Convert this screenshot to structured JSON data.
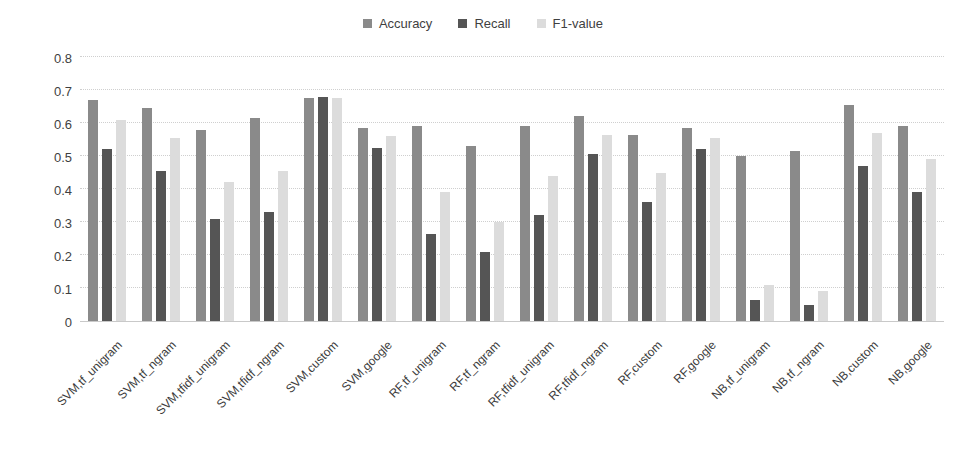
{
  "page": {
    "background": "#ffffff",
    "text_color": "#3f3f3f"
  },
  "legend": {
    "items": [
      {
        "label": "Accuracy",
        "color": "#8a8a8a"
      },
      {
        "label": "Recall",
        "color": "#555555"
      },
      {
        "label": "F1-value",
        "color": "#dcdcdc"
      }
    ]
  },
  "chart_data": {
    "type": "bar",
    "title": "",
    "xlabel": "",
    "ylabel": "",
    "grid": true,
    "legend_position": "top-center",
    "ylim": [
      0,
      0.8
    ],
    "yticks": [
      0,
      0.1,
      0.2,
      0.3,
      0.4,
      0.5,
      0.6,
      0.7,
      0.8
    ],
    "categories": [
      "SVM,tf_unigram",
      "SVM,tf_ngram",
      "SVM,tfidf_unigram",
      "SVM,tfidf_ngram",
      "SVM,custom",
      "SVM,google",
      "RF,tf_unigram",
      "RF,tf_ngram",
      "RF,tfidf_unigram",
      "RF,tfidf_ngram",
      "RF,custom",
      "RF,google",
      "NB,tf_unigram",
      "NB,tf_ngram",
      "NB,custom",
      "NB,google"
    ],
    "series": [
      {
        "name": "Accuracy",
        "color": "#8a8a8a",
        "values": [
          0.67,
          0.645,
          0.58,
          0.615,
          0.675,
          0.585,
          0.59,
          0.53,
          0.59,
          0.62,
          0.565,
          0.585,
          0.5,
          0.515,
          0.655,
          0.59
        ]
      },
      {
        "name": "Recall",
        "color": "#555555",
        "values": [
          0.52,
          0.455,
          0.31,
          0.33,
          0.68,
          0.525,
          0.265,
          0.21,
          0.32,
          0.505,
          0.36,
          0.52,
          0.065,
          0.05,
          0.47,
          0.39
        ]
      },
      {
        "name": "F1-value",
        "color": "#dcdcdc",
        "values": [
          0.61,
          0.555,
          0.42,
          0.455,
          0.675,
          0.56,
          0.39,
          0.3,
          0.44,
          0.565,
          0.45,
          0.555,
          0.11,
          0.09,
          0.57,
          0.49
        ]
      }
    ]
  }
}
